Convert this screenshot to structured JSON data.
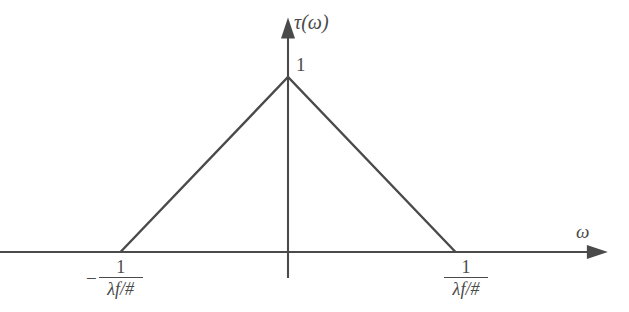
{
  "figure": {
    "name": "optical-transfer-function-triangle",
    "background_color": "#ffffff",
    "line_color": "#4a4a4a",
    "y_axis_title": "τ(ω)",
    "x_axis_title": "ω",
    "peak_value_label": "1",
    "tick_left": {
      "sign": "−",
      "numerator": "1",
      "denominator": "λf/#"
    },
    "tick_right": {
      "sign": "",
      "numerator": "1",
      "denominator": "λf/#"
    }
  },
  "chart_data": {
    "type": "line",
    "title": "",
    "xlabel": "ω",
    "ylabel": "τ(ω)",
    "x": [
      -1,
      0,
      1
    ],
    "y": [
      0,
      1,
      0
    ],
    "x_tick_labels": [
      "−1/(λf/#)",
      "",
      "1/(λf/#)"
    ],
    "x_tick_values": [
      -1,
      0,
      1
    ],
    "y_tick_labels": [
      "1"
    ],
    "y_tick_values": [
      1
    ],
    "xlim": [
      -1.72,
      1.91
    ],
    "ylim": [
      0,
      1.34
    ],
    "grid": false,
    "legend": null,
    "series": [
      {
        "name": "τ(ω)",
        "values": [
          0,
          1,
          0
        ]
      }
    ],
    "annotations": [
      {
        "text": "1",
        "x": 0,
        "y": 1,
        "placement": "right-of-peak"
      },
      {
        "text": "τ(ω)",
        "x": 0,
        "y": 1.34,
        "placement": "y-axis-arrow-tip"
      },
      {
        "text": "ω",
        "x": 1.91,
        "y": 0,
        "placement": "x-axis-arrow-tip"
      }
    ]
  }
}
